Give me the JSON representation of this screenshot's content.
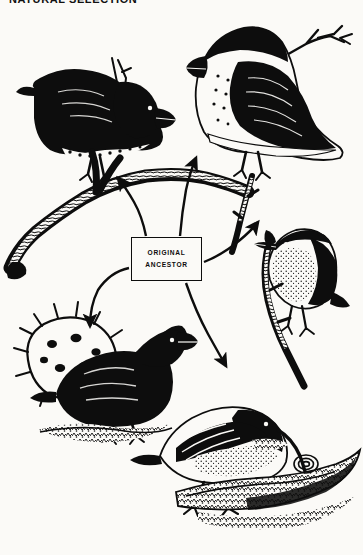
{
  "header": {
    "title": "NATURAL SELECTION"
  },
  "figure": {
    "caption_box": {
      "line1": "ORIGINAL",
      "line2": "ANCESTOR"
    },
    "background_color": "#fbfaf7",
    "ink_color": "#0d0d0d"
  },
  "birds": [
    {
      "id": "large-ground-finch",
      "label": "dark finch perched on branch, upper left",
      "position": "top-left"
    },
    {
      "id": "large-cactus-finch",
      "label": "pale-breasted speckled finch on twig, upper right",
      "position": "top-right"
    },
    {
      "id": "warbler-finch",
      "label": "small finch with slender beak on vertical twig, middle right",
      "position": "middle-right"
    },
    {
      "id": "cactus-ground-finch",
      "label": "solid black finch beside spiny cactus pad, lower left",
      "position": "bottom-left"
    },
    {
      "id": "woodpecker-finch",
      "label": "finch with long probing beak on rocky branch, lower right",
      "position": "bottom-right"
    }
  ],
  "arrows": [
    {
      "id": "arrow-to-top-left",
      "from": "original-ancestor",
      "to": "large-ground-finch"
    },
    {
      "id": "arrow-to-top-right",
      "from": "original-ancestor",
      "to": "large-cactus-finch"
    },
    {
      "id": "arrow-to-middle-right",
      "from": "original-ancestor",
      "to": "warbler-finch"
    },
    {
      "id": "arrow-to-bottom-left",
      "from": "original-ancestor",
      "to": "cactus-ground-finch"
    },
    {
      "id": "arrow-to-bottom-right",
      "from": "original-ancestor",
      "to": "woodpecker-finch"
    }
  ]
}
